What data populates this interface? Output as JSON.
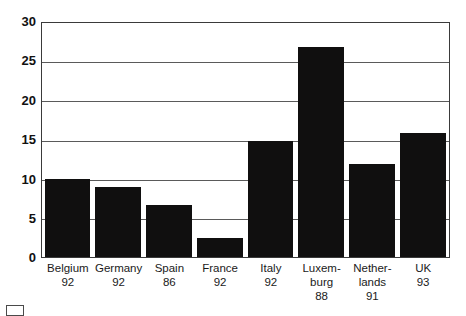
{
  "chart_data": {
    "type": "bar",
    "title": "",
    "subtitle": "",
    "xlabel": "",
    "ylabel": "",
    "ylim": [
      0,
      30
    ],
    "yticks": [
      0,
      5,
      10,
      15,
      20,
      25,
      30
    ],
    "ytick_labels": [
      "0",
      "5",
      "10",
      "15",
      "20",
      "25",
      "30"
    ],
    "grid": true,
    "legend": "none",
    "bar_color": "#100f0f",
    "axis_color": "#3a3a3a",
    "categories": [
      "Belgium",
      "Germany",
      "Spain",
      "France",
      "Italy",
      "Luxem-\nburg",
      "Nether-\nlands",
      "UK"
    ],
    "category_years": [
      "92",
      "92",
      "86",
      "92",
      "92",
      "88",
      "91",
      "93"
    ],
    "values": [
      10,
      9,
      6.7,
      2.5,
      15,
      27,
      12,
      16
    ]
  },
  "axis": {
    "y_label_0": "0",
    "y_label_5": "5",
    "y_label_10": "10",
    "y_label_15": "15",
    "y_label_20": "20",
    "y_label_25": "25",
    "y_label_30": "30"
  },
  "xlabels": [
    {
      "name": "Belgium",
      "year": "92"
    },
    {
      "name": "Germany",
      "year": "92"
    },
    {
      "name": "Spain",
      "year": "86"
    },
    {
      "name": "France",
      "year": "92"
    },
    {
      "name": "Italy",
      "year": "92"
    },
    {
      "name": "Luxem-\nburg",
      "year": "88"
    },
    {
      "name": "Nether-\nlands",
      "year": "91"
    },
    {
      "name": "UK",
      "year": "93"
    }
  ]
}
